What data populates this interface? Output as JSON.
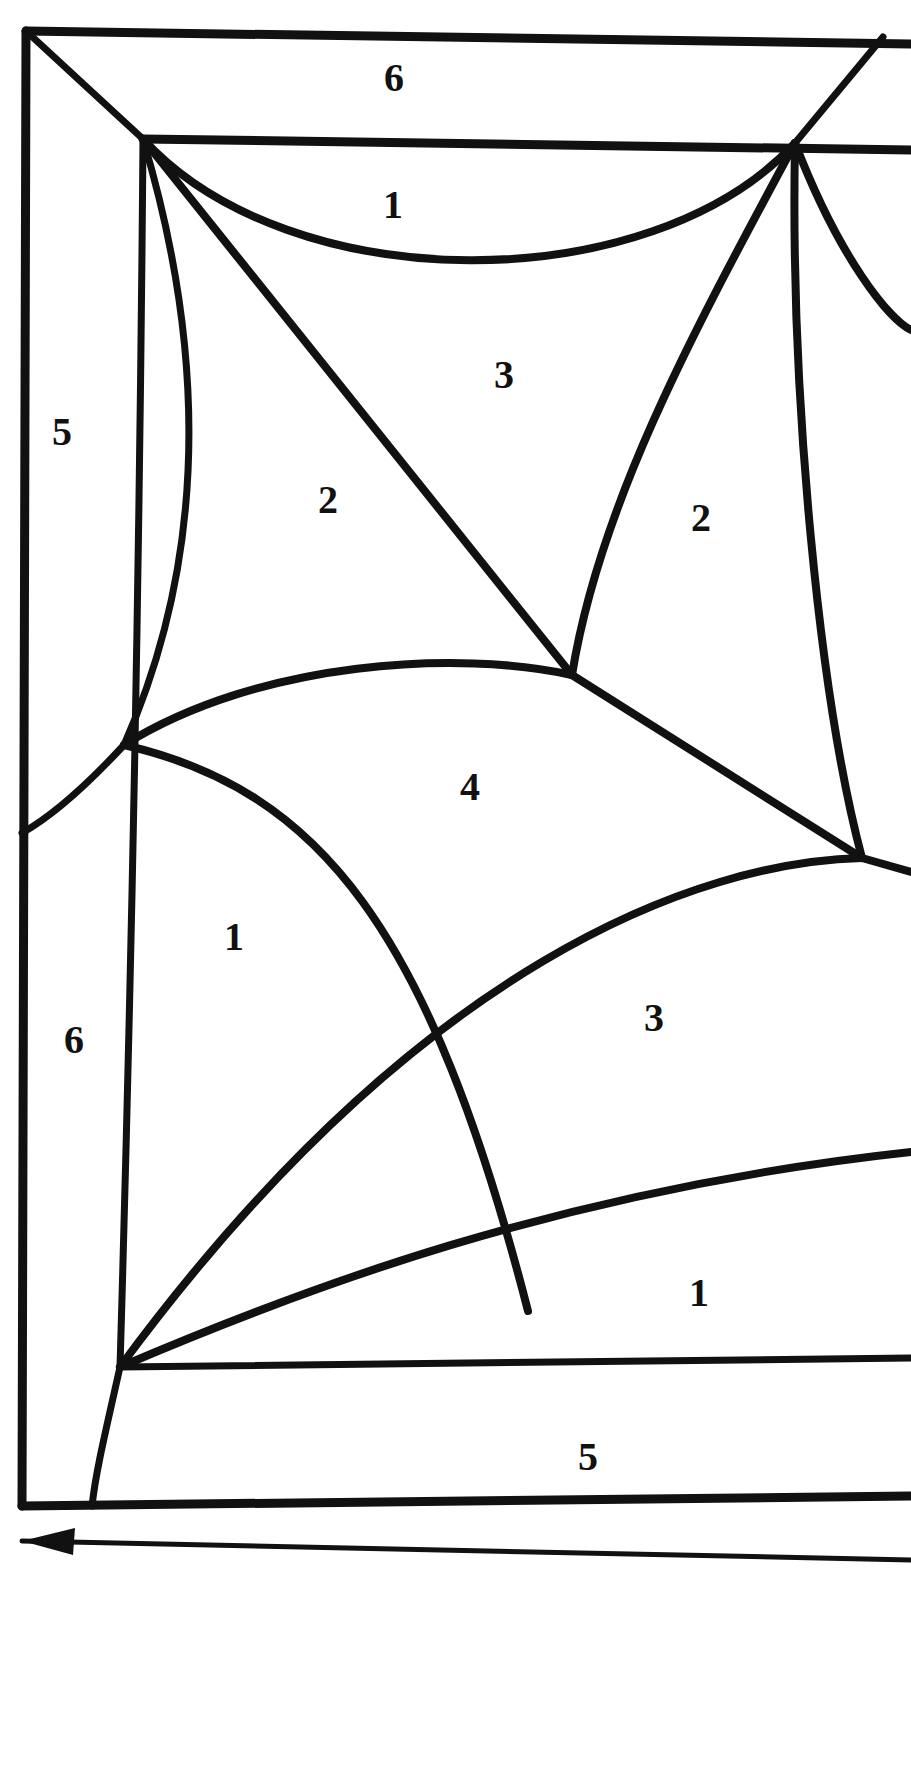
{
  "figure": {
    "kind": "line-diagram",
    "title": "",
    "background_color": "#ffffff",
    "stroke_color": "#111111",
    "label_color": "#111111",
    "canvas": {
      "width": 911,
      "height": 1770
    }
  },
  "labels": [
    {
      "id": "label-top-6",
      "text": "6",
      "x": 394,
      "y": 78,
      "size": 40
    },
    {
      "id": "label-upper-1",
      "text": "1",
      "x": 393,
      "y": 205,
      "size": 40
    },
    {
      "id": "label-left-5",
      "text": "5",
      "x": 62,
      "y": 432,
      "size": 40
    },
    {
      "id": "label-center-3",
      "text": "3",
      "x": 504,
      "y": 375,
      "size": 40
    },
    {
      "id": "label-center-2",
      "text": "2",
      "x": 328,
      "y": 500,
      "size": 40
    },
    {
      "id": "label-right-2",
      "text": "2",
      "x": 701,
      "y": 518,
      "size": 40
    },
    {
      "id": "label-center-4",
      "text": "4",
      "x": 470,
      "y": 787,
      "size": 40
    },
    {
      "id": "label-lower-1",
      "text": "1",
      "x": 234,
      "y": 937,
      "size": 40
    },
    {
      "id": "label-lower-left-6",
      "text": "6",
      "x": 74,
      "y": 1040,
      "size": 40
    },
    {
      "id": "label-lower-3",
      "text": "3",
      "x": 654,
      "y": 1018,
      "size": 40
    },
    {
      "id": "label-bottom-1",
      "text": "1",
      "x": 699,
      "y": 1293,
      "size": 40
    },
    {
      "id": "label-bottom-5",
      "text": "5",
      "x": 588,
      "y": 1457,
      "size": 40
    }
  ],
  "annotations": {
    "direction_arrow": {
      "id": "direction-arrow",
      "description": "leftward arrow below figure",
      "points_to": "left"
    }
  },
  "geometry": {
    "outer_frame": {
      "top_left": [
        26,
        31
      ],
      "top_right": [
        911,
        44
      ],
      "bottom_left": [
        22,
        1506
      ],
      "bottom_right": [
        911,
        1496
      ]
    },
    "vertices": [
      {
        "id": "v-top-left-inner",
        "x": 143,
        "y": 139
      },
      {
        "id": "v-top-right-inner",
        "x": 795,
        "y": 143
      },
      {
        "id": "v-mid-left",
        "x": 124,
        "y": 745
      },
      {
        "id": "v-mid-center",
        "x": 572,
        "y": 675
      },
      {
        "id": "v-right-mid",
        "x": 862,
        "y": 858
      },
      {
        "id": "v-bottom-left",
        "x": 120,
        "y": 1367
      },
      {
        "id": "v-cross-lower",
        "x": 440,
        "y": 1058
      },
      {
        "id": "v-cross-bottom",
        "x": 528,
        "y": 1311
      }
    ]
  }
}
